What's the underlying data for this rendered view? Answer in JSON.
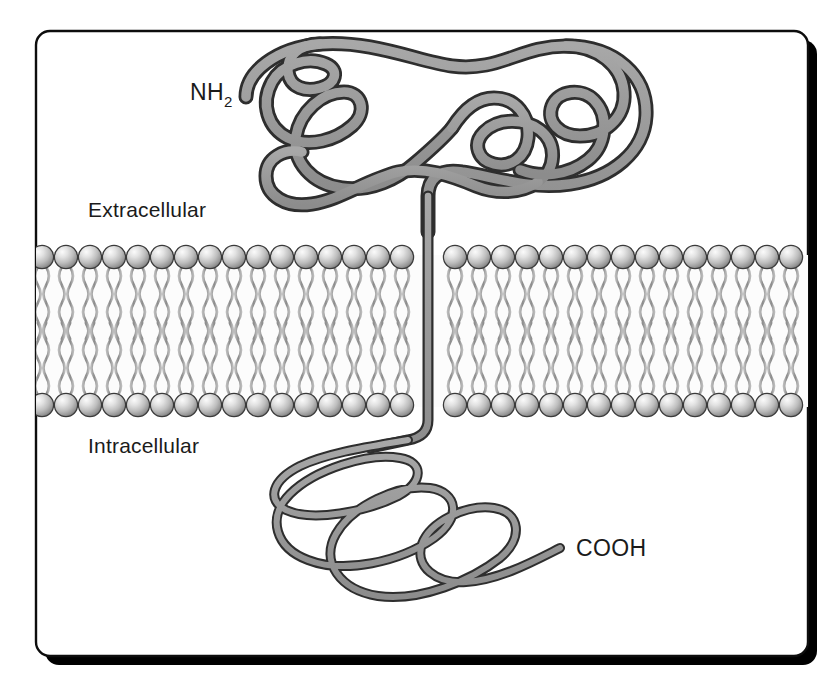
{
  "figure": {
    "background_color": "#ffffff",
    "frame": {
      "border_color": "#0d0d0d",
      "shadow_color": "#000000",
      "fill_color": "#ffffff",
      "corner_radius": 14
    }
  },
  "labels": {
    "n_terminus": "NH",
    "n_terminus_subscript": "2",
    "extracellular": "Extracellular",
    "intracellular": "Intracellular",
    "c_terminus": "COOH"
  },
  "protein": {
    "name": "transmembrane-protein",
    "ribbon_fill": "#9a9a9a",
    "ribbon_stroke": "#2e2e2e",
    "extracellular_domain_width": 13,
    "transmembrane_segment_width": 9,
    "intracellular_domain_width": 8,
    "topology": "type-I single-pass",
    "domains": [
      {
        "name": "extracellular-domain",
        "region": "extracellular",
        "description": "large folded meandering ribbon above the bilayer ending at the NH2 terminus"
      },
      {
        "name": "transmembrane-segment",
        "region": "membrane",
        "description": "single straight segment crossing the bilayer at x=430"
      },
      {
        "name": "intracellular-domain",
        "region": "intracellular",
        "description": "coiled overlapping loops below the bilayer ending at the COOH terminus"
      }
    ]
  },
  "membrane": {
    "name": "phospholipid-bilayer",
    "head_count_per_row": 32,
    "head_radius": 12,
    "head_fill_light": "#f2f2f2",
    "head_fill_mid": "#b4b4b4",
    "head_fill_dark": "#6f6f6f",
    "head_stroke": "#3a3a3a",
    "tail_color": "#8e8e8e",
    "interior_fill": "#fbfbfb",
    "outer_leaflet_y": 257,
    "inner_leaflet_y": 405,
    "left_edge": 30,
    "right_edge": 807
  },
  "geometry": {
    "frame_x": 36,
    "frame_y": 31,
    "frame_width": 772,
    "frame_height": 625,
    "shadow_offset": 9,
    "label_positions": {
      "n_terminus": {
        "x": 190,
        "y": 100
      },
      "extracellular": {
        "x": 88,
        "y": 217
      },
      "intracellular": {
        "x": 88,
        "y": 453
      },
      "c_terminus": {
        "x": 576,
        "y": 556
      }
    }
  }
}
